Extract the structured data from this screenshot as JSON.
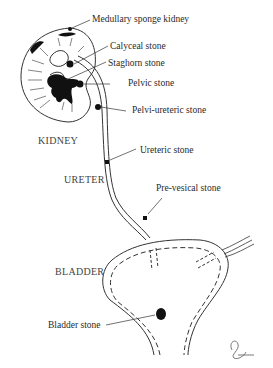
{
  "labels": {
    "medullary_sponge": "Medullary sponge kidney",
    "calyceal": "Calyceal stone",
    "staghorn": "Staghorn stone",
    "pelvic": "Pelvic stone",
    "pelviureteric": "Pelvi-ureteric stone",
    "ureteric": "Ureteric stone",
    "prevesical": "Pre-vesical stone",
    "bladder_stone": "Bladder stone"
  },
  "captions": {
    "kidney": "KIDNEY",
    "ureter": "URETER",
    "bladder": "BLADDER"
  },
  "colors": {
    "line": "#333333",
    "stone": "#111111",
    "text": "#2a2a2a"
  }
}
